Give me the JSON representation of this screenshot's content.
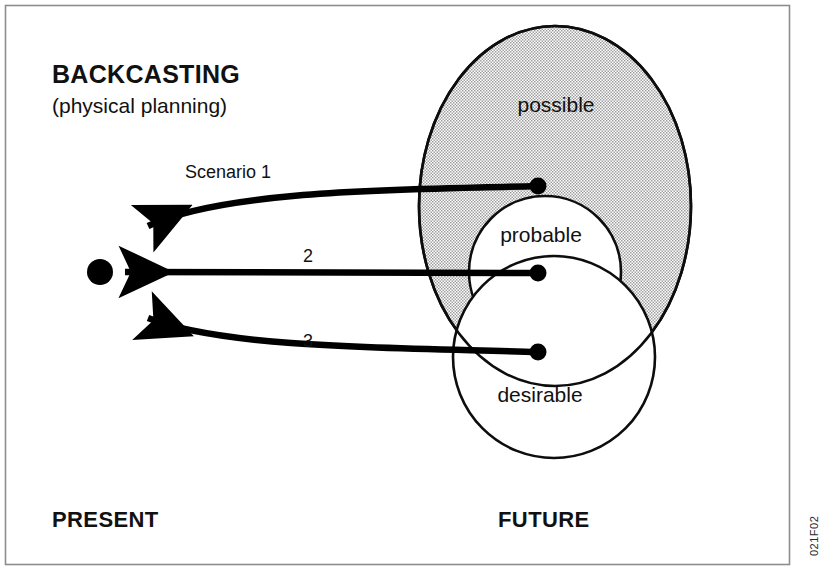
{
  "figure": {
    "title": "BACKCASTING",
    "subtitle": "(physical planning)",
    "present_label": "PRESENT",
    "future_label": "FUTURE",
    "plate_code": "021F02",
    "background_color": "#ffffff",
    "ink_color": "#000000",
    "frame_color": "#8d8d8d",
    "shade_color": "#b9b9b9"
  },
  "regions": [
    {
      "id": "possible",
      "label": "possible",
      "shape": "ellipse",
      "cx": 555,
      "cy": 206,
      "rx": 136,
      "ry": 180,
      "filled": "stippled",
      "label_x": 556,
      "label_y": 112
    },
    {
      "id": "probable",
      "label": "probable",
      "shape": "circle",
      "cx": 545,
      "cy": 272,
      "rx": 76,
      "ry": 76,
      "filled": "white",
      "label_x": 541,
      "label_y": 242
    },
    {
      "id": "desirable",
      "label": "desirable",
      "shape": "circle",
      "cx": 554,
      "cy": 357,
      "rx": 101,
      "ry": 101,
      "filled": "white",
      "label_x": 540,
      "label_y": 402
    }
  ],
  "present_node": {
    "label": "present-point",
    "x": 100,
    "y": 272,
    "radius": 13
  },
  "scenarios": [
    {
      "id": "scenario-1",
      "label": "Scenario   1",
      "label_x": 228,
      "label_y": 178,
      "origin_x": 538,
      "origin_y": 186,
      "target_x": 100,
      "target_y": 272,
      "curve": "arc-down"
    },
    {
      "id": "scenario-2",
      "label": "2",
      "label_x": 308,
      "label_y": 262,
      "origin_x": 538,
      "origin_y": 273,
      "target_x": 100,
      "target_y": 272,
      "curve": "straight"
    },
    {
      "id": "scenario-3",
      "label": "3",
      "label_x": 308,
      "label_y": 347,
      "origin_x": 538,
      "origin_y": 352,
      "target_x": 100,
      "target_y": 272,
      "curve": "arc-up"
    }
  ]
}
